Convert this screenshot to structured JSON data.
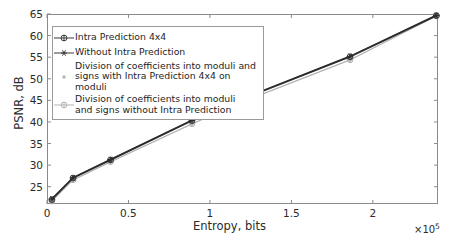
{
  "chart_data": {
    "type": "line",
    "title": "",
    "xlabel": "Entropy, bits",
    "ylabel": "PSNR, dB",
    "x_multiplier": "×10",
    "x_multiplier_exp": "5",
    "xlim": [
      0,
      240000
    ],
    "ylim": [
      21,
      65
    ],
    "xtick_labels": [
      "0",
      "0.5",
      "1",
      "1.5",
      "2"
    ],
    "xtick_values": [
      0,
      50000,
      100000,
      150000,
      200000
    ],
    "ytick_labels": [
      "25",
      "30",
      "35",
      "40",
      "45",
      "50",
      "55",
      "60",
      "65"
    ],
    "ytick_values": [
      25,
      30,
      35,
      40,
      45,
      50,
      55,
      60,
      65
    ],
    "grid": false,
    "legend_position": "upper-left",
    "series": [
      {
        "name": "Intra Prediction 4x4",
        "color": "#3c3c3c",
        "marker": "circle-plus",
        "x": [
          3000,
          16000,
          39000,
          89000,
          122000,
          186000,
          239000
        ],
        "values": [
          22.0,
          27.0,
          31.2,
          40.3,
          45.6,
          55.1,
          64.6
        ]
      },
      {
        "name": "Without Intra Prediction",
        "color": "#2b2b2b",
        "marker": "asterisk",
        "x": [
          3000,
          16000,
          39000,
          89000,
          122000,
          186000,
          239000
        ],
        "values": [
          22.2,
          27.1,
          31.3,
          40.4,
          45.7,
          55.2,
          64.7
        ]
      },
      {
        "name": "Division of coefficients into moduli and\nsigns with Intra Prediction 4x4 on moduli",
        "color": "#b9b9b9",
        "marker": "dot",
        "x": [
          3000,
          16000,
          39000,
          89000,
          122000,
          186000,
          239000
        ],
        "values": [
          21.6,
          26.5,
          30.7,
          39.5,
          44.9,
          54.3,
          64.5
        ]
      },
      {
        "name": "Division of coefficients into moduli\nand signs without Intra Prediction",
        "color": "#aeaeae",
        "marker": "circle-plus",
        "x": [
          3000,
          16000,
          39000,
          89000,
          122000,
          186000,
          239000
        ],
        "values": [
          21.7,
          26.6,
          30.8,
          39.6,
          45.0,
          54.4,
          64.6
        ]
      }
    ]
  },
  "legend": {
    "items": [
      {
        "label": "Intra Prediction 4x4",
        "marker": "circle-plus-dark"
      },
      {
        "label": "Without Intra Prediction",
        "marker": "asterisk-dark"
      },
      {
        "label": "Division of coefficients into moduli and\nsigns with Intra Prediction 4x4 on moduli",
        "marker": "dot-gray"
      },
      {
        "label": "Division of coefficients into moduli\nand signs without Intra Prediction",
        "marker": "circle-plus-gray"
      }
    ]
  }
}
